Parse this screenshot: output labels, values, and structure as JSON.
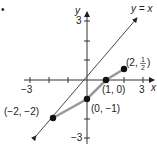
{
  "figure": {
    "bullet": "•",
    "axes": {
      "x_label": "x",
      "y_label": "y",
      "x_min_label": "−3",
      "x_max_label": "3",
      "y_max_label": "3",
      "y_min_label": "−3"
    },
    "line_label": "y = x",
    "points": [
      {
        "label": "(−2, −2)",
        "x": -2,
        "y": -2
      },
      {
        "label": "(0, −1)",
        "x": 0,
        "y": -1
      },
      {
        "label": "(1, 0)",
        "x": 1,
        "y": 0
      },
      {
        "label_prefix": "(2, ",
        "label_num": "1",
        "label_den": "2",
        "label_suffix": ")",
        "x": 2,
        "y": 0.5
      }
    ]
  }
}
